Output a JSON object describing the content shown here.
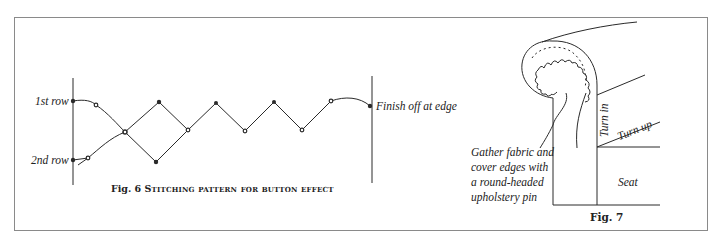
{
  "figure6": {
    "caption_number": "Fig. 6",
    "caption_text": "Stitching pattern for button effect",
    "labels": {
      "first_row": "1st row",
      "second_row": "2nd row",
      "finish": "Finish off at edge"
    }
  },
  "figure7": {
    "caption": "Fig. 7",
    "labels": {
      "gather_note_line1": "Gather fabric and",
      "gather_note_line2": "cover edges with",
      "gather_note_line3": "a round-headed",
      "gather_note_line4": "upholstery pin",
      "turn_in": "Turn in",
      "turn_up": "Turn up",
      "seat": "Seat"
    }
  },
  "colors": {
    "line": "#2a2a2a",
    "frame": "#8a8a8a",
    "background": "#ffffff"
  }
}
